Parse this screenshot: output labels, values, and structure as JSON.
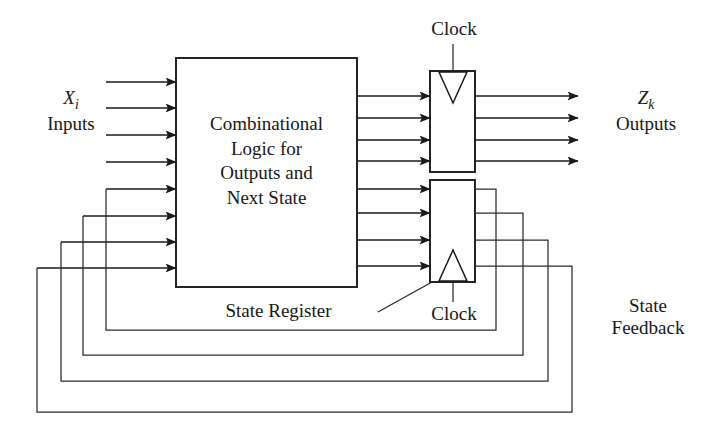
{
  "figure": {
    "type": "block-diagram",
    "background_color": "#ffffff",
    "line_color": "#1a1a1a"
  },
  "blocks": {
    "combinational": {
      "text_lines": [
        "Combinational",
        "Logic for",
        "Outputs and",
        "Next State"
      ],
      "full_text": "Combinational Logic for Outputs and Next State"
    },
    "output_register": {
      "name": "output-register",
      "clock_edge_symbol": "V",
      "clock_label": "Clock"
    },
    "state_register": {
      "name": "state-register",
      "clock_edge_symbol": "A",
      "clock_label": "Clock",
      "caption": "State Register"
    }
  },
  "labels": {
    "inputs_symbol": "X",
    "inputs_subscript": "i",
    "inputs_word": "Inputs",
    "outputs_symbol": "Z",
    "outputs_subscript": "k",
    "outputs_word": "Outputs",
    "clock_top": "Clock",
    "clock_bottom": "Clock",
    "state_register_caption": "State Register",
    "state_feedback_line1": "State",
    "state_feedback_line2": "Feedback"
  },
  "counts": {
    "external_input_arrows": 4,
    "feedback_input_arrows": 4,
    "logic_to_output_register_arrows": 4,
    "logic_to_state_register_arrows": 4,
    "external_output_arrows": 4,
    "feedback_loops": 4
  }
}
